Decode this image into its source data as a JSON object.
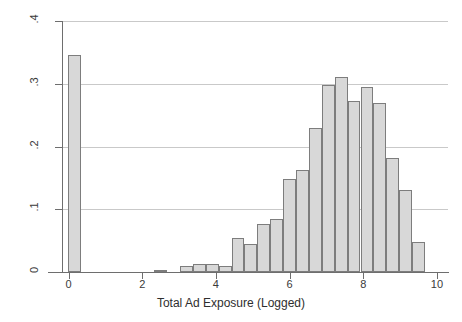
{
  "chart_data": {
    "type": "bar",
    "title": "",
    "subtitle": "",
    "xlabel": "Total Ad Exposure (Logged)",
    "ylabel": "Density",
    "xlim": [
      -0.15,
      10.3
    ],
    "ylim": [
      0,
      0.4
    ],
    "grid": "horizontal",
    "legend": null,
    "bar_width": 0.35,
    "fill_color": "#d8d8d8",
    "edge_color": "#7d7d7d",
    "grid_color": "#c9c9c9",
    "axis_color": "#6e6e6e",
    "xticks": [
      0,
      2,
      4,
      6,
      8,
      10
    ],
    "xtick_labels": [
      "0",
      "2",
      "4",
      "6",
      "8",
      "10"
    ],
    "yticks": [
      0,
      0.1,
      0.2,
      0.3,
      0.4
    ],
    "ytick_labels": [
      "0",
      ".1",
      ".2",
      ".3",
      ".4"
    ],
    "x": [
      0.17,
      2.5,
      3.2,
      3.55,
      3.9,
      4.25,
      4.6,
      4.95,
      5.3,
      5.65,
      6.0,
      6.35,
      6.7,
      7.05,
      7.4,
      7.75,
      8.1,
      8.45,
      8.8,
      9.15,
      9.5
    ],
    "values": [
      0.346,
      0.004,
      0.01,
      0.012,
      0.013,
      0.01,
      0.055,
      0.045,
      0.077,
      0.085,
      0.148,
      0.163,
      0.23,
      0.298,
      0.31,
      0.272,
      0.295,
      0.27,
      0.182,
      0.13,
      0.048
    ],
    "bars": [
      {
        "label": "0.2",
        "x": 0.17,
        "value": 0.346
      },
      {
        "label": "2.5",
        "x": 2.5,
        "value": 0.004
      },
      {
        "label": "3.2",
        "x": 3.2,
        "value": 0.01
      },
      {
        "label": "3.6",
        "x": 3.55,
        "value": 0.012
      },
      {
        "label": "3.9",
        "x": 3.9,
        "value": 0.013
      },
      {
        "label": "4.3",
        "x": 4.25,
        "value": 0.01
      },
      {
        "label": "4.6",
        "x": 4.6,
        "value": 0.055
      },
      {
        "label": "5.0",
        "x": 4.95,
        "value": 0.045
      },
      {
        "label": "5.3",
        "x": 5.3,
        "value": 0.077
      },
      {
        "label": "5.7",
        "x": 5.65,
        "value": 0.085
      },
      {
        "label": "6.0",
        "x": 6.0,
        "value": 0.148
      },
      {
        "label": "6.4",
        "x": 6.35,
        "value": 0.163
      },
      {
        "label": "6.7",
        "x": 6.7,
        "value": 0.23
      },
      {
        "label": "7.1",
        "x": 7.05,
        "value": 0.298
      },
      {
        "label": "7.4",
        "x": 7.4,
        "value": 0.31
      },
      {
        "label": "7.8",
        "x": 7.75,
        "value": 0.272
      },
      {
        "label": "8.1",
        "x": 8.1,
        "value": 0.295
      },
      {
        "label": "8.5",
        "x": 8.45,
        "value": 0.27
      },
      {
        "label": "8.8",
        "x": 8.8,
        "value": 0.182
      },
      {
        "label": "9.2",
        "x": 9.15,
        "value": 0.13
      },
      {
        "label": "9.5",
        "x": 9.5,
        "value": 0.048
      }
    ]
  }
}
